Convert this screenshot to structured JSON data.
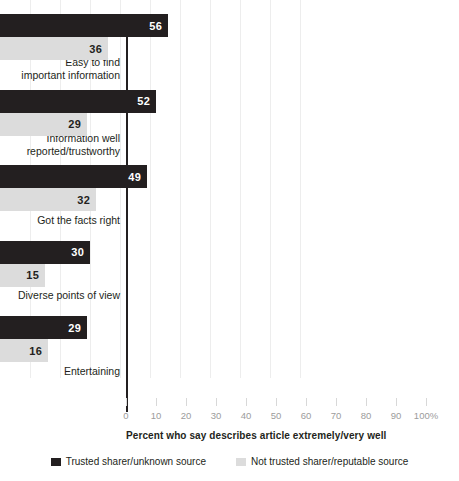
{
  "chart_data": {
    "type": "bar",
    "orientation": "horizontal",
    "title": "",
    "xlabel": "Percent who say describes article extremely/very well",
    "ylabel": "",
    "xlim": [
      0,
      100
    ],
    "grid": true,
    "legend_position": "bottom",
    "categories": [
      "Easy to find important information",
      "Information well reported/trustworthy",
      "Got the facts right",
      "Diverse points of view",
      "Entertaining"
    ],
    "category_lines": [
      [
        "Easy to find",
        "important information"
      ],
      [
        "Information well",
        "reported/trustworthy"
      ],
      [
        "Got the facts right"
      ],
      [
        "Diverse points of view"
      ],
      [
        "Entertaining"
      ]
    ],
    "series": [
      {
        "name": "Trusted sharer/unknown source",
        "color": "#231f20",
        "values": [
          56,
          52,
          49,
          30,
          29
        ]
      },
      {
        "name": "Not trusted sharer/reputable source",
        "color": "#dcdcdc",
        "values": [
          36,
          29,
          32,
          15,
          16
        ]
      }
    ],
    "xticks": [
      0,
      10,
      20,
      30,
      40,
      50,
      60,
      70,
      80,
      90,
      100
    ],
    "xtick_labels": [
      "0",
      "10",
      "20",
      "30",
      "40",
      "50",
      "60",
      "70",
      "80",
      "90",
      "100%"
    ]
  },
  "legend": {
    "items": [
      {
        "label": "Trusted sharer/unknown source",
        "color": "#231f20"
      },
      {
        "label": "Not trusted sharer/reputable source",
        "color": "#dcdcdc"
      }
    ]
  },
  "axis": {
    "title": "Percent who say describes article extremely/very well"
  }
}
